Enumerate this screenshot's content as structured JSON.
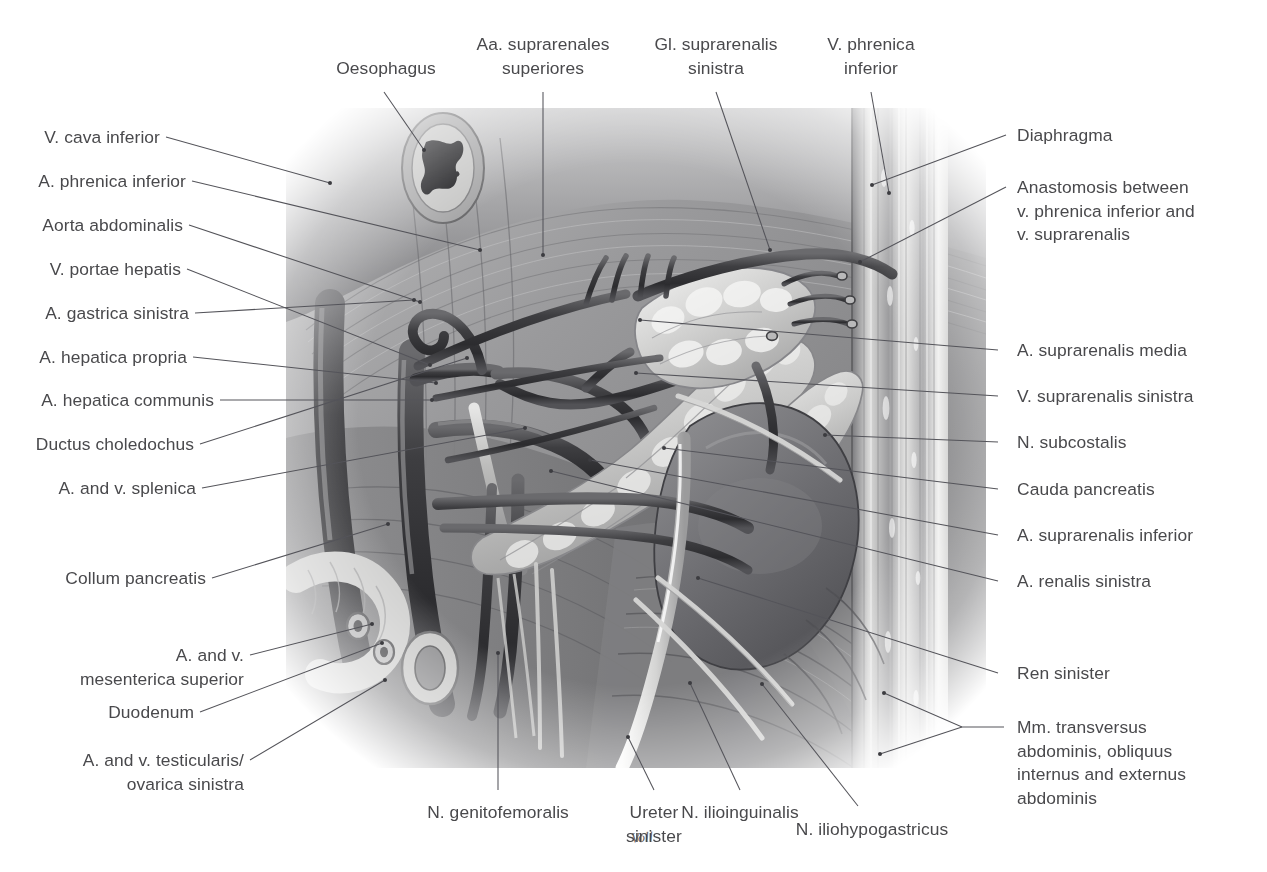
{
  "figure": {
    "kind": "anatomical-illustration",
    "rendering": "grayscale airbrush / pencil medical illustration",
    "artist_signature": "Voll"
  },
  "labels": {
    "top": [
      {
        "id": "oesophagus",
        "text": "Oesophagus",
        "align": "center"
      },
      {
        "id": "aa-suprarenales-superiores",
        "text": "Aa. suprarenales\nsuperiores",
        "align": "center"
      },
      {
        "id": "gl-suprarenalis-sinistra",
        "text": "Gl. suprarenalis\nsinistra",
        "align": "center"
      },
      {
        "id": "v-phrenica-inferior",
        "text": "V. phrenica\ninferior",
        "align": "center"
      }
    ],
    "left": [
      {
        "id": "v-cava-inferior",
        "text": "V. cava inferior"
      },
      {
        "id": "a-phrenica-inferior",
        "text": "A. phrenica inferior"
      },
      {
        "id": "aorta-abdominalis",
        "text": "Aorta abdominalis"
      },
      {
        "id": "v-portae-hepatis",
        "text": "V. portae hepatis"
      },
      {
        "id": "a-gastrica-sinistra",
        "text": "A. gastrica sinistra"
      },
      {
        "id": "a-hepatica-propria",
        "text": "A. hepatica propria"
      },
      {
        "id": "a-hepatica-communis",
        "text": "A. hepatica communis"
      },
      {
        "id": "ductus-choledochus",
        "text": "Ductus choledochus"
      },
      {
        "id": "a-and-v-splenica",
        "text": "A. and v. splenica"
      },
      {
        "id": "collum-pancreatis",
        "text": "Collum pancreatis"
      },
      {
        "id": "a-and-v-mesenterica-superior",
        "text": "A. and v.\nmesenterica superior"
      },
      {
        "id": "duodenum",
        "text": "Duodenum"
      },
      {
        "id": "a-and-v-testicularis-ovarica-sinistra",
        "text": "A. and v. testicularis/\novarica sinistra"
      }
    ],
    "right": [
      {
        "id": "diaphragma",
        "text": "Diaphragma"
      },
      {
        "id": "anastomosis-phrenica-suprarenalis",
        "text": "Anastomosis between\nv. phrenica inferior and\nv. suprarenalis"
      },
      {
        "id": "a-suprarenalis-media",
        "text": "A. suprarenalis media"
      },
      {
        "id": "v-suprarenalis-sinistra",
        "text": "V. suprarenalis sinistra"
      },
      {
        "id": "n-subcostalis",
        "text": "N. subcostalis"
      },
      {
        "id": "cauda-pancreatis",
        "text": "Cauda pancreatis"
      },
      {
        "id": "a-suprarenalis-inferior",
        "text": "A. suprarenalis inferior"
      },
      {
        "id": "a-renalis-sinistra",
        "text": "A. renalis sinistra"
      },
      {
        "id": "ren-sinister",
        "text": "Ren sinister"
      },
      {
        "id": "mm-transversus-obliquus",
        "text": "Mm. transversus\nabdominis, obliquus\ninternus and externus\nabdominis"
      }
    ],
    "bottom": [
      {
        "id": "n-genitofemoralis",
        "text": "N. genitofemoralis",
        "align": "center"
      },
      {
        "id": "ureter-sinister",
        "text": "Ureter\nsinister",
        "align": "center"
      },
      {
        "id": "n-ilioinguinalis",
        "text": "N. ilioinguinalis",
        "align": "center"
      },
      {
        "id": "n-iliohypogastricus",
        "text": "N. iliohypogastricus",
        "align": "center"
      }
    ]
  },
  "colors": {
    "text": "#49494c",
    "leader": "#54545a",
    "background": "#ffffff",
    "illustration_dark": "#3c3c3f",
    "illustration_mid": "#8c8c8f",
    "illustration_light": "#d8d8d8"
  }
}
